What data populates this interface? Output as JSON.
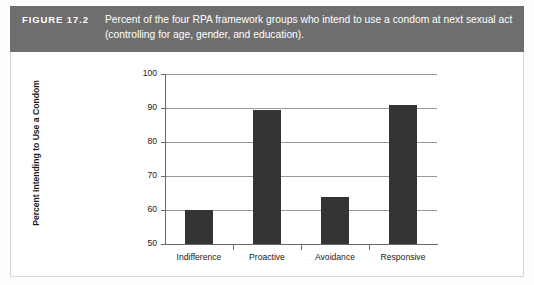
{
  "figure": {
    "number_label": "FIGURE 17.2",
    "caption": "Percent of the four RPA framework groups who intend to use a condom at next sexual act (controlling for age, gender, and education)."
  },
  "colors": {
    "caption_band": "#6e6e6e",
    "caption_text": "#ffffff",
    "bar_fill": "#343434",
    "gridline": "#9a9a9a",
    "axis": "#6a6a6a",
    "panel_background": "#ffffff",
    "panel_border": "#d8d8d6"
  },
  "chart_data": {
    "type": "bar",
    "title": "",
    "subtitle": "",
    "categories": [
      "Indifference",
      "Proactive",
      "Avoidance",
      "Responsive"
    ],
    "values": [
      60.0,
      89.5,
      63.7,
      91.0
    ],
    "xlabel": "",
    "ylabel": "Percent Intending to Use a Condom",
    "ylim": [
      50,
      100
    ],
    "yticks": [
      50,
      60,
      70,
      80,
      90,
      100
    ],
    "ytick_labels": [
      "50",
      "60",
      "70",
      "80",
      "90",
      "100"
    ],
    "grid": true,
    "grid_axis": "y",
    "legend": false,
    "legend_position": "none",
    "bar_color": "#343434",
    "annotations": []
  }
}
